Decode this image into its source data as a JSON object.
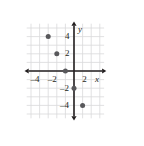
{
  "figure": {
    "name": "coordinate-plane-with-plotted-points",
    "background": "#ffffff",
    "grid_color": "#d9d9db",
    "axis_color": "#231f20",
    "point_color": "#58585b",
    "width": 144,
    "height": 146
  },
  "chart_data": {
    "type": "scatter",
    "title": "",
    "xlabel": "x",
    "ylabel": "y",
    "xlim": [
      -5.5,
      3.5
    ],
    "ylim": [
      -5.5,
      5.5
    ],
    "grid": true,
    "legend": false,
    "x_ticks": [
      -4,
      -2,
      2
    ],
    "x_tick_labels": [
      "–4",
      "–2",
      "2"
    ],
    "y_ticks": [
      4,
      2,
      -2,
      -4
    ],
    "y_tick_labels": [
      "4",
      "2",
      "–2",
      "–4"
    ],
    "points": [
      {
        "x": -3,
        "y": 4
      },
      {
        "x": -2,
        "y": 2
      },
      {
        "x": -1,
        "y": 0
      },
      {
        "x": 0,
        "y": -2
      },
      {
        "x": 1,
        "y": -4
      }
    ]
  },
  "axes": {
    "x_axis_label": "x",
    "y_axis_label": "y"
  }
}
